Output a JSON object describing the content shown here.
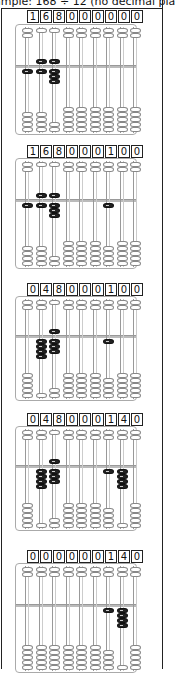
{
  "header": {
    "text": "ample: 168 ÷ 12 (no decimal pla"
  },
  "abacus_layout": {
    "rods": 9,
    "upper_beads": 2,
    "lower_beads": 5,
    "upper_value": 5
  },
  "steps": [
    {
      "digits": [
        "1",
        "6",
        "8",
        "0",
        "0",
        "0",
        "0",
        "0",
        "0"
      ],
      "values": [
        1,
        6,
        8,
        0,
        0,
        0,
        0,
        0,
        0
      ]
    },
    {
      "digits": [
        "1",
        "6",
        "8",
        "0",
        "0",
        "0",
        "1",
        "0",
        "0"
      ],
      "values": [
        1,
        6,
        8,
        0,
        0,
        0,
        1,
        0,
        0
      ]
    },
    {
      "digits": [
        "0",
        "4",
        "8",
        "0",
        "0",
        "0",
        "1",
        "0",
        "0"
      ],
      "values": [
        0,
        4,
        8,
        0,
        0,
        0,
        1,
        0,
        0
      ]
    },
    {
      "digits": [
        "0",
        "4",
        "8",
        "0",
        "0",
        "0",
        "1",
        "4",
        "0"
      ],
      "values": [
        0,
        4,
        8,
        0,
        0,
        0,
        1,
        4,
        0
      ]
    },
    {
      "digits": [
        "0",
        "0",
        "0",
        "0",
        "0",
        "0",
        "1",
        "4",
        "0"
      ],
      "values": [
        0,
        0,
        0,
        0,
        0,
        0,
        1,
        4,
        0
      ]
    }
  ],
  "colors": {
    "active_bead": "#222222",
    "inactive_bead": "#ffffff",
    "frame": "#aaaaaa"
  }
}
